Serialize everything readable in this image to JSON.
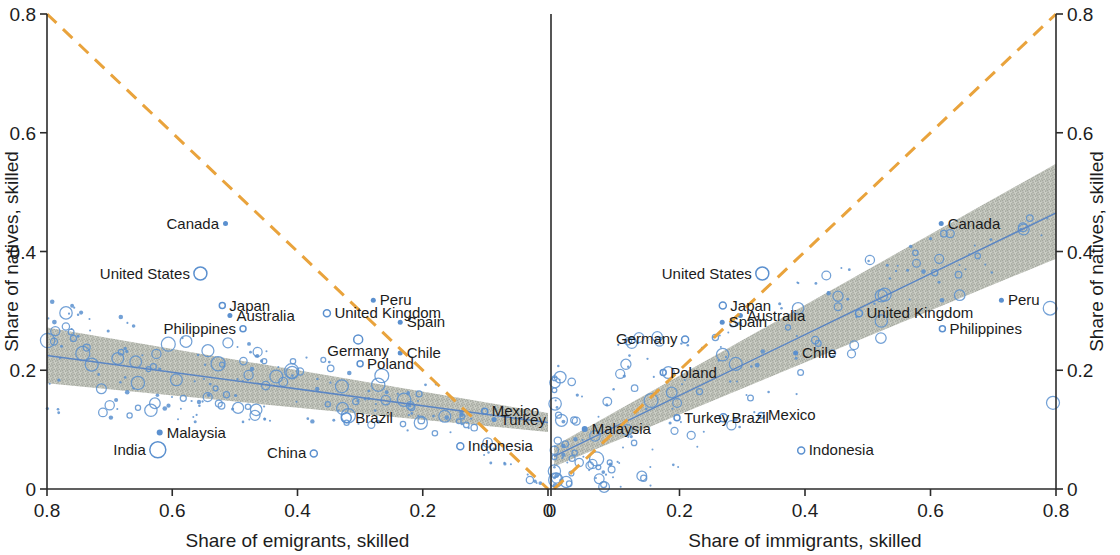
{
  "figure": {
    "left_panel": {
      "xlabel": "Share of emigrants, skilled",
      "ylabel": "Share of natives, skilled",
      "xticks": [
        "0.8",
        "0.6",
        "0.4",
        "0.2",
        "0"
      ],
      "xtickvals": [
        0.8,
        0.6,
        0.4,
        0.2,
        0
      ],
      "yticks": [
        "0.8",
        "0.6",
        "0.4",
        "0.2",
        "0"
      ],
      "ytickvals": [
        0.8,
        0.6,
        0.4,
        0.2,
        0
      ]
    },
    "right_panel": {
      "xlabel": "Share of immigrants, skilled",
      "ylabel": "Share of natives, skilled",
      "xticks": [
        "0",
        "0.2",
        "0.4",
        "0.6",
        "0.8"
      ],
      "xtickvals": [
        0,
        0.2,
        0.4,
        0.6,
        0.8
      ],
      "yticks": [
        "0.8",
        "0.6",
        "0.4",
        "0.2",
        "0"
      ],
      "ytickvals": [
        0.8,
        0.6,
        0.4,
        0.2,
        0
      ]
    },
    "colors": {
      "dashed_reference_line": "#e9a33c",
      "fit_line": "#5b86c4",
      "confidence_band": "#b9bdb4",
      "marker": "#5b90cf",
      "axis": "#2b2b2b"
    }
  },
  "chart_data": {
    "type": "scatter",
    "title": "",
    "panels": [
      {
        "name": "emigrants",
        "xlabel": "Share of emigrants, skilled",
        "ylabel": "Share of natives, skilled",
        "xlim": [
          0.8,
          0.0
        ],
        "ylim": [
          0.0,
          0.8
        ],
        "x_axis_reversed": true,
        "grid": false,
        "fit_line": {
          "x": [
            0.8,
            0.0
          ],
          "y": [
            0.225,
            0.112
          ],
          "color": "#5b86c4"
        },
        "confidence_band": {
          "x": [
            0.8,
            0.0
          ],
          "upper": [
            0.272,
            0.128
          ],
          "lower": [
            0.178,
            0.096
          ],
          "color": "#b9bdb4"
        },
        "reference_line": {
          "type": "dashed",
          "x": [
            0.8,
            0.0
          ],
          "y": [
            0.8,
            0.0
          ],
          "color": "#e9a33c",
          "note": "45-degree reference"
        },
        "labeled_points": [
          {
            "label": "Canada",
            "x": 0.515,
            "y": 0.447,
            "size": 5,
            "filled": true,
            "label_side": "left"
          },
          {
            "label": "United States",
            "x": 0.555,
            "y": 0.363,
            "size": 13,
            "filled": false,
            "label_side": "left"
          },
          {
            "label": "Japan",
            "x": 0.52,
            "y": 0.309,
            "size": 6,
            "filled": false,
            "label_side": "right"
          },
          {
            "label": "Australia",
            "x": 0.508,
            "y": 0.292,
            "size": 5,
            "filled": true,
            "label_side": "right"
          },
          {
            "label": "Philippines",
            "x": 0.487,
            "y": 0.27,
            "size": 6,
            "filled": false,
            "label_side": "left"
          },
          {
            "label": "United Kingdom",
            "x": 0.353,
            "y": 0.296,
            "size": 7,
            "filled": false,
            "label_side": "right"
          },
          {
            "label": "Peru",
            "x": 0.279,
            "y": 0.318,
            "size": 5,
            "filled": true,
            "label_side": "right"
          },
          {
            "label": "Spain",
            "x": 0.236,
            "y": 0.281,
            "size": 5,
            "filled": true,
            "label_side": "right"
          },
          {
            "label": "Germany",
            "x": 0.303,
            "y": 0.252,
            "size": 9,
            "filled": false,
            "label_side": "below"
          },
          {
            "label": "Chile",
            "x": 0.236,
            "y": 0.229,
            "size": 5,
            "filled": true,
            "label_side": "right"
          },
          {
            "label": "Poland",
            "x": 0.3,
            "y": 0.211,
            "size": 6,
            "filled": false,
            "label_side": "right"
          },
          {
            "label": "Mexico",
            "x": 0.101,
            "y": 0.131,
            "size": 6,
            "filled": false,
            "label_side": "right"
          },
          {
            "label": "Turkey",
            "x": 0.086,
            "y": 0.117,
            "size": 5,
            "filled": true,
            "label_side": "right"
          },
          {
            "label": "Brazil",
            "x": 0.322,
            "y": 0.12,
            "size": 10,
            "filled": false,
            "label_side": "right"
          },
          {
            "label": "Indonesia",
            "x": 0.14,
            "y": 0.072,
            "size": 7,
            "filled": false,
            "label_side": "right"
          },
          {
            "label": "Malaysia",
            "x": 0.62,
            "y": 0.095,
            "size": 6,
            "filled": true,
            "label_side": "right"
          },
          {
            "label": "India",
            "x": 0.623,
            "y": 0.066,
            "size": 16,
            "filled": false,
            "label_side": "left"
          },
          {
            "label": "China",
            "x": 0.374,
            "y": 0.06,
            "size": 7,
            "filled": false,
            "label_side": "left"
          }
        ],
        "unlabeled_points_note": "dense cloud of ~200 small blue circles, mostly below y=0.2, concentrated near x<0.3"
      },
      {
        "name": "immigrants",
        "xlabel": "Share of immigrants, skilled",
        "ylabel": "Share of natives, skilled",
        "xlim": [
          0.0,
          0.8
        ],
        "ylim": [
          0.0,
          0.8
        ],
        "x_axis_reversed": false,
        "grid": false,
        "fit_line": {
          "x": [
            0.0,
            0.8
          ],
          "y": [
            0.055,
            0.465
          ],
          "color": "#5b86c4"
        },
        "confidence_band": {
          "x": [
            0.0,
            0.8
          ],
          "upper": [
            0.072,
            0.548
          ],
          "lower": [
            0.038,
            0.388
          ],
          "color": "#b9bdb4"
        },
        "reference_line": {
          "type": "dashed",
          "x": [
            0.0,
            0.8
          ],
          "y": [
            0.0,
            0.8
          ],
          "color": "#e9a33c",
          "note": "45-degree reference"
        },
        "labeled_points": [
          {
            "label": "Canada",
            "x": 0.617,
            "y": 0.447,
            "size": 5,
            "filled": true,
            "label_side": "right"
          },
          {
            "label": "United States",
            "x": 0.332,
            "y": 0.363,
            "size": 13,
            "filled": false,
            "label_side": "left"
          },
          {
            "label": "Peru",
            "x": 0.713,
            "y": 0.318,
            "size": 5,
            "filled": true,
            "label_side": "right"
          },
          {
            "label": "Japan",
            "x": 0.269,
            "y": 0.309,
            "size": 7,
            "filled": false,
            "label_side": "right"
          },
          {
            "label": "Australia",
            "x": 0.297,
            "y": 0.292,
            "size": 5,
            "filled": true,
            "label_side": "right"
          },
          {
            "label": "United Kingdom",
            "x": 0.486,
            "y": 0.296,
            "size": 7,
            "filled": false,
            "label_side": "right"
          },
          {
            "label": "Spain",
            "x": 0.268,
            "y": 0.281,
            "size": 5,
            "filled": true,
            "label_side": "right"
          },
          {
            "label": "Philippines",
            "x": 0.619,
            "y": 0.27,
            "size": 6,
            "filled": false,
            "label_side": "right"
          },
          {
            "label": "Germany",
            "x": 0.209,
            "y": 0.252,
            "size": 7,
            "filled": false,
            "label_side": "left"
          },
          {
            "label": "Chile",
            "x": 0.385,
            "y": 0.229,
            "size": 5,
            "filled": true,
            "label_side": "right"
          },
          {
            "label": "Poland",
            "x": 0.174,
            "y": 0.196,
            "size": 6,
            "filled": false,
            "label_side": "right"
          },
          {
            "label": "Turkey",
            "x": 0.196,
            "y": 0.12,
            "size": 6,
            "filled": false,
            "label_side": "right"
          },
          {
            "label": "Brazil",
            "x": 0.27,
            "y": 0.12,
            "size": 8,
            "filled": false,
            "label_side": "right"
          },
          {
            "label": "Mexico",
            "x": 0.33,
            "y": 0.124,
            "size": 6,
            "filled": false,
            "label_side": "right"
          },
          {
            "label": "Malaysia",
            "x": 0.049,
            "y": 0.101,
            "size": 6,
            "filled": true,
            "label_side": "right"
          },
          {
            "label": "Indonesia",
            "x": 0.394,
            "y": 0.065,
            "size": 7,
            "filled": false,
            "label_side": "right"
          }
        ],
        "unlabeled_points_note": "dense cloud of ~200 small blue circles hugging the low-x, low-y corner"
      }
    ]
  }
}
